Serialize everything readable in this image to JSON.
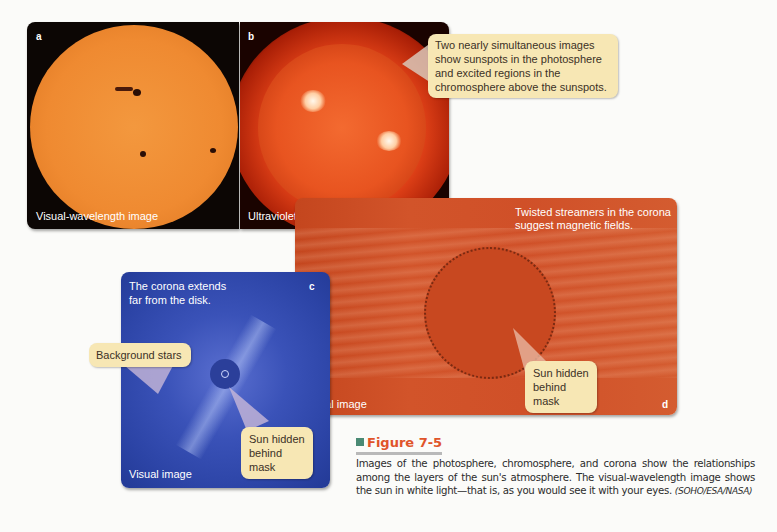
{
  "figure": {
    "number": "Figure 7-5",
    "accent_color": "#e0542a",
    "marker_color": "#4a8a74",
    "caption": "Images of the photosphere, chromosphere, and corona show the relationships among the layers of the sun's atmosphere. The visual-wavelength image shows the sun in white light—that is, as you would see it with your eyes.",
    "credit": "(SOHO/ESA/NASA)"
  },
  "panels": {
    "a": {
      "letter": "a",
      "label": "Visual-wavelength image"
    },
    "b": {
      "letter": "b",
      "label": "Ultraviolet"
    },
    "c": {
      "letter": "c",
      "label": "Visual image",
      "note": "The corona extends far from the disk."
    },
    "d": {
      "letter": "d",
      "label": "Visual image",
      "note": "Twisted streamers in the corona suggest magnetic fields."
    }
  },
  "callouts": {
    "ab": "Two nearly simultaneous images show sunspots in the photosphere and excited regions in the chromosphere above the sunspots.",
    "stars": "Background stars",
    "c_mask": "Sun hidden behind mask",
    "d_mask": "Sun hidden behind mask"
  }
}
